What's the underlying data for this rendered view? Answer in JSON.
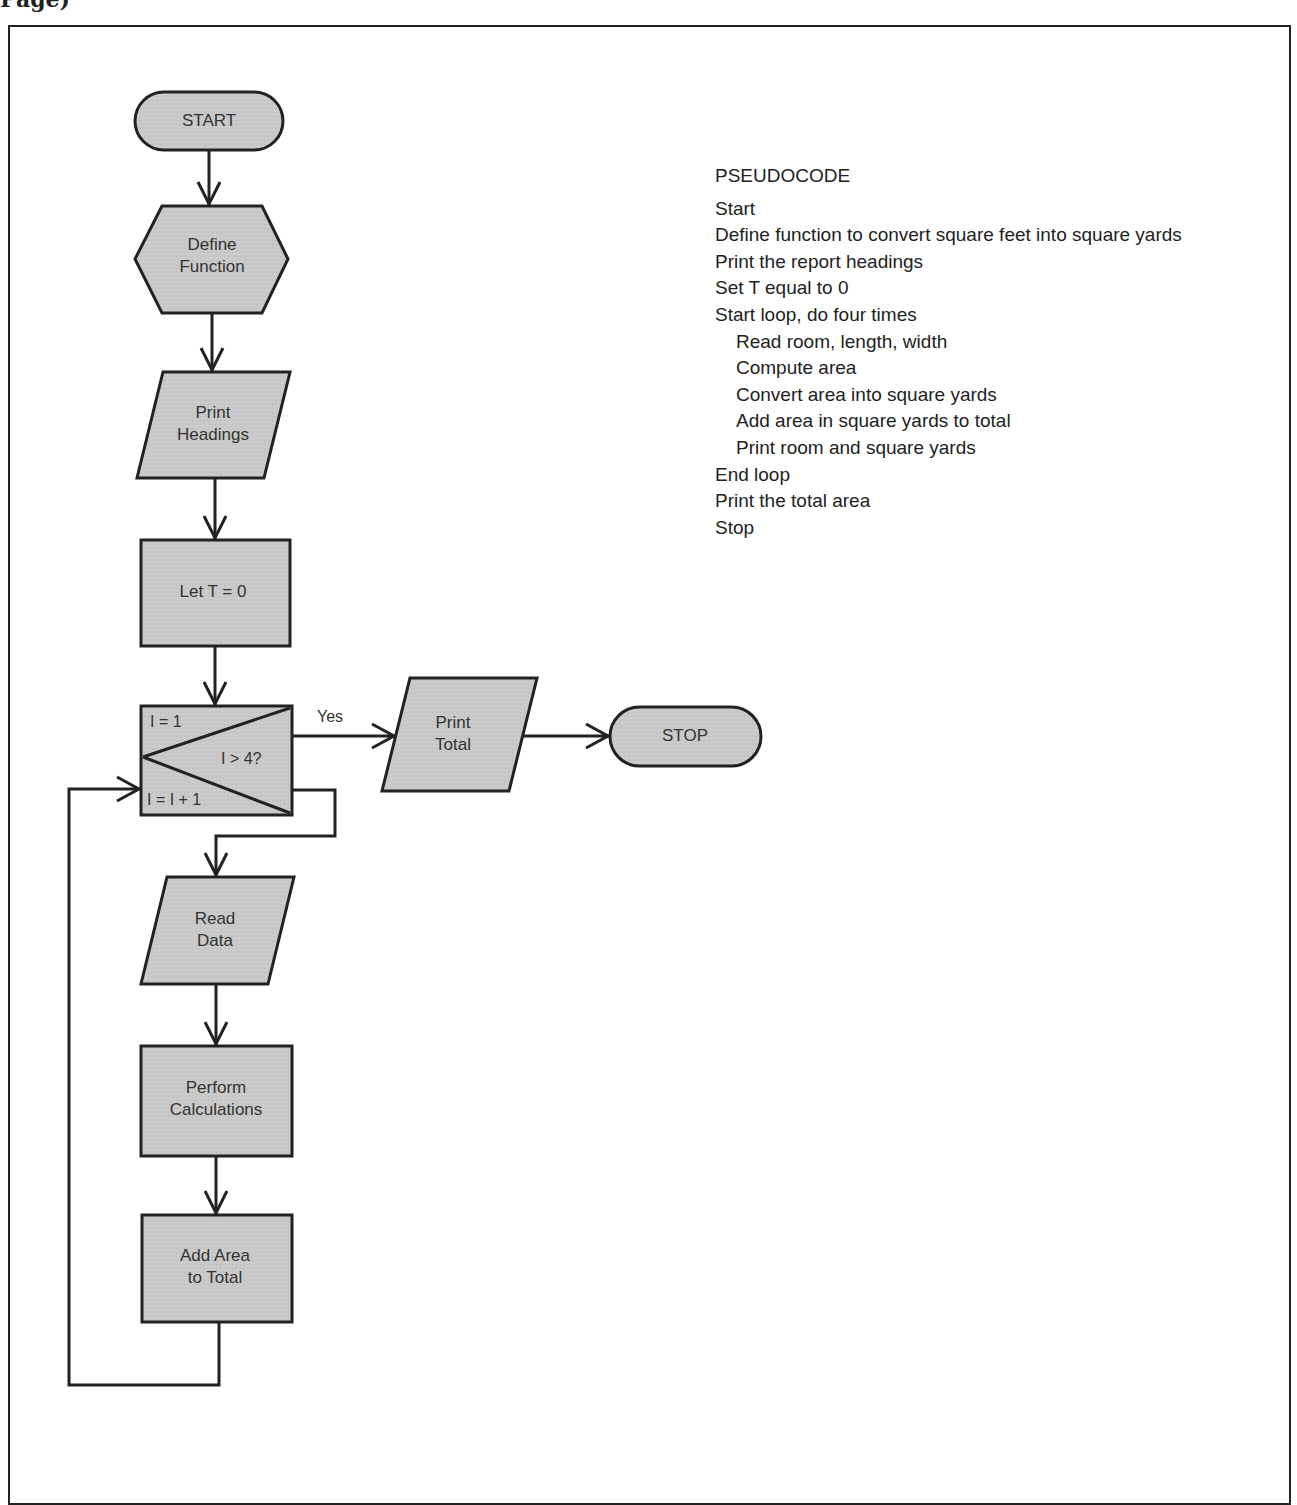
{
  "page_header": "Page)",
  "flowchart": {
    "fill_color": "#c8c8c8",
    "stroke_color": "#222222",
    "nodes": {
      "start": {
        "shape": "terminal",
        "label": "START"
      },
      "define_function": {
        "shape": "hexagon",
        "label_line1": "Define",
        "label_line2": "Function"
      },
      "print_headings": {
        "shape": "parallelogram",
        "label_line1": "Print",
        "label_line2": "Headings"
      },
      "let_t": {
        "shape": "rectangle",
        "label": "Let T = 0"
      },
      "loop": {
        "shape": "loop-box",
        "init": "I = 1",
        "test": "I > 4?",
        "increment": "I = I + 1"
      },
      "read_data": {
        "shape": "parallelogram",
        "label_line1": "Read",
        "label_line2": "Data"
      },
      "perform_calculations": {
        "shape": "rectangle",
        "label_line1": "Perform",
        "label_line2": "Calculations"
      },
      "add_area": {
        "shape": "rectangle",
        "label_line1": "Add Area",
        "label_line2": "to Total"
      },
      "print_total": {
        "shape": "parallelogram",
        "label_line1": "Print",
        "label_line2": "Total"
      },
      "stop": {
        "shape": "terminal",
        "label": "STOP"
      }
    },
    "edge_labels": {
      "yes": "Yes"
    }
  },
  "pseudocode": {
    "title": "PSEUDOCODE",
    "lines": [
      {
        "text": "Start",
        "indent": 0
      },
      {
        "text": "Define function to convert square feet into square yards",
        "indent": 0
      },
      {
        "text": "Print the report headings",
        "indent": 0
      },
      {
        "text": "Set T equal to 0",
        "indent": 0
      },
      {
        "text": "Start loop, do four times",
        "indent": 0
      },
      {
        "text": "Read room, length, width",
        "indent": 1
      },
      {
        "text": "Compute area",
        "indent": 1
      },
      {
        "text": "Convert area into square yards",
        "indent": 1
      },
      {
        "text": "Add area in square yards to total",
        "indent": 1
      },
      {
        "text": "Print room and square yards",
        "indent": 1
      },
      {
        "text": "End loop",
        "indent": 0
      },
      {
        "text": "Print the total area",
        "indent": 0
      },
      {
        "text": "Stop",
        "indent": 0
      }
    ]
  }
}
